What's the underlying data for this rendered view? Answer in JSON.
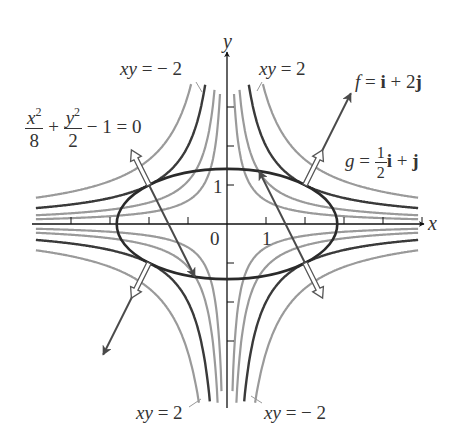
{
  "diagram": {
    "origin_px": [
      227,
      224
    ],
    "unit_px": 39,
    "axes": {
      "x_label": "x",
      "y_label": "y",
      "origin_label": "0",
      "x_tick_label": "1",
      "y_tick_label": "1",
      "x_range": [
        -5,
        5
      ],
      "y_range": [
        -5,
        4.6
      ],
      "x_ticks": [
        -2,
        -1,
        1,
        2,
        3,
        4,
        5,
        -3,
        -4
      ],
      "y_ticks": [
        -3,
        -2,
        -1,
        1,
        2,
        3
      ]
    },
    "hyperbolas": {
      "dark_c": [
        2,
        -2
      ],
      "light_c": [
        0.6,
        1.1,
        3.3,
        -0.6,
        -1.1,
        -3.3
      ],
      "clip_x": [
        -4.9,
        4.9
      ],
      "clip_y": [
        -4.6,
        3.6
      ],
      "dark_color": "#3a3a3a",
      "light_color": "#9a9a9a"
    },
    "ellipse": {
      "equation": "x^2/8 + y^2/2 - 1 = 0",
      "a": 2.828,
      "b": 1.414,
      "color": "#2a2a2a"
    },
    "tangency_points": [
      [
        2,
        1
      ],
      [
        -2,
        1
      ],
      [
        2,
        -1
      ],
      [
        -2,
        -1
      ]
    ],
    "gradient_vectors": {
      "f_scale": 1.05,
      "g_scale": 0.9,
      "f_color": "#4a4a4a",
      "g_color": "#555555"
    },
    "labels": {
      "xy_neg2_top": {
        "lhs": "xy",
        "eq": " = ",
        "rhs": "− 2"
      },
      "xy_pos2_top": {
        "lhs": "xy",
        "eq": " = ",
        "rhs": "2"
      },
      "xy_pos2_bottom": {
        "lhs": "xy",
        "eq": " = ",
        "rhs": "2"
      },
      "xy_neg2_bottom": {
        "lhs": "xy",
        "eq": " = ",
        "rhs": "− 2"
      },
      "constraint": {
        "num1": "x",
        "exp1": "2",
        "den1": "8",
        "plus": " + ",
        "num2": "y",
        "exp2": "2",
        "den2": "2",
        "rest": " − 1 = 0"
      },
      "f_vector": {
        "name": "f",
        "eq": " = ",
        "i": "i",
        "mid": " + 2",
        "j": "j"
      },
      "g_vector": {
        "name": "g",
        "eq": " = ",
        "frac_num": "1",
        "frac_den": "2",
        "i": "i",
        "plus": " + ",
        "j": "j"
      }
    }
  }
}
